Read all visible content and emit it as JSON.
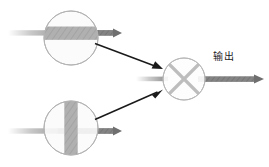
{
  "diagram": {
    "type": "optical-beam-combiner-schematic",
    "background_color": "#ffffff",
    "labels": {
      "output": "输出"
    },
    "colors": {
      "circle_outline": "#b3b3b3",
      "circle_fill": "#fbfbfb",
      "band_fill": "#b0b0b0",
      "band_hatch": "#9a9a9a",
      "gray_arrow": "#8a8a8a",
      "gray_arrow_dark": "#6f6f6f",
      "black_arrow": "#1a1a1a",
      "cross_stroke": "#bdbdbd",
      "text": "#1a1a1a"
    },
    "nodes": [
      {
        "name": "horizontal-polarizer",
        "shape": "circle",
        "cx": 71,
        "cy": 38,
        "r": 27,
        "band_orientation": "horizontal",
        "band_thickness": 13
      },
      {
        "name": "vertical-polarizer",
        "shape": "circle",
        "cx": 71,
        "cy": 128,
        "r": 27,
        "band_orientation": "vertical",
        "band_thickness": 13
      },
      {
        "name": "beam-combiner",
        "shape": "circle-with-cross",
        "cx": 184,
        "cy": 79,
        "r": 21,
        "band_orientation": "cross"
      }
    ],
    "connections": [
      {
        "name": "top-input-beam",
        "style": "gray-arrow",
        "from_x": 8,
        "from_y": 33,
        "to_x": 118,
        "to_y": 33,
        "faded_start": true
      },
      {
        "name": "bottom-input-beam",
        "style": "gray-arrow",
        "from_x": 8,
        "from_y": 131,
        "to_x": 118,
        "to_y": 131,
        "faded_start": true
      },
      {
        "name": "center-input-beam",
        "style": "gray-arrow-short",
        "from_x": 136,
        "from_y": 79,
        "to_x": 165,
        "to_y": 79,
        "faded_start": true
      },
      {
        "name": "top-to-combiner-link",
        "style": "black-arrow",
        "from_x": 95,
        "from_y": 44,
        "to_x": 162,
        "to_y": 69
      },
      {
        "name": "bottom-to-combiner-link",
        "style": "black-arrow",
        "from_x": 95,
        "from_y": 119,
        "to_x": 162,
        "to_y": 93
      },
      {
        "name": "output-beam",
        "style": "gray-arrow",
        "from_x": 200,
        "from_y": 79,
        "to_x": 263,
        "to_y": 79,
        "faded_start": false
      }
    ]
  }
}
